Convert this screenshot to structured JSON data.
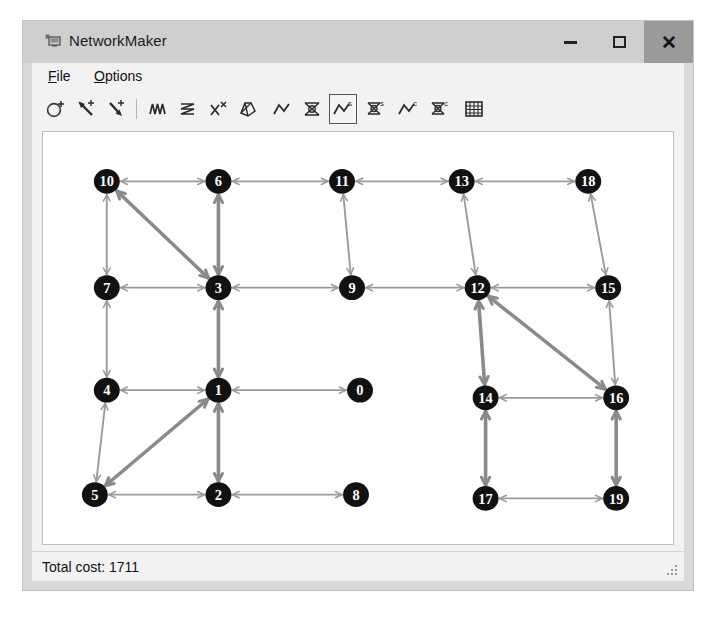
{
  "window": {
    "title": "NetworkMaker",
    "app_icon": "app-window-icon",
    "controls": {
      "minimize": "minimize-icon",
      "maximize": "maximize-icon",
      "close": "close-icon"
    }
  },
  "menu": {
    "items": [
      {
        "label": "File",
        "accel": "F"
      },
      {
        "label": "Options",
        "accel": "O"
      }
    ]
  },
  "toolbar": {
    "tools": [
      {
        "name": "add-node-icon",
        "title": "Add node",
        "selected": false
      },
      {
        "name": "add-edge-icon",
        "title": "Add edge",
        "selected": false
      },
      {
        "name": "add-directed-edge-icon",
        "title": "Add directed edge",
        "selected": false
      },
      {
        "name": "random-walk-icon",
        "title": "Random walk",
        "selected": false
      },
      {
        "name": "zigzag-path-icon",
        "title": "Zigzag path",
        "selected": false
      },
      {
        "name": "cross-edges-icon",
        "title": "Cross edges",
        "selected": false
      },
      {
        "name": "minimum-spanning-tree-icon",
        "title": "Minimum spanning tree",
        "selected": false
      },
      {
        "name": "shortest-path-icon",
        "title": "Shortest path",
        "selected": false
      },
      {
        "name": "network-flow-icon",
        "title": "Network flow",
        "selected": false
      },
      {
        "name": "network-flow-source-icon",
        "title": "Network flow (source)",
        "selected": true
      },
      {
        "name": "spanning-tree-source-icon",
        "title": "Spanning tree (source)",
        "selected": false
      },
      {
        "name": "shortest-path-cost-icon",
        "title": "Shortest path (cost)",
        "selected": false
      },
      {
        "name": "spanning-tree-cost-icon",
        "title": "Spanning tree (cost)",
        "selected": false
      },
      {
        "name": "grid-icon",
        "title": "Grid",
        "selected": false
      }
    ]
  },
  "status": {
    "total_cost_label": "Total cost: 1711"
  },
  "colors": {
    "node_fill": "#111111",
    "node_label": "#ffffff",
    "edge_normal": "#9b9b9b",
    "edge_highlight": "#8a8a8a",
    "canvas": "#fefefe",
    "window_chrome": "#cfcfcf",
    "client": "#f2f2f2",
    "close_button": "#9a9a9a"
  },
  "graph": {
    "node_radius": 13,
    "nodes": [
      {
        "id": "10",
        "x": 64,
        "y": 52
      },
      {
        "id": "6",
        "x": 176,
        "y": 52
      },
      {
        "id": "11",
        "x": 300,
        "y": 52
      },
      {
        "id": "13",
        "x": 420,
        "y": 52
      },
      {
        "id": "18",
        "x": 547,
        "y": 52
      },
      {
        "id": "7",
        "x": 64,
        "y": 164
      },
      {
        "id": "3",
        "x": 176,
        "y": 164
      },
      {
        "id": "9",
        "x": 310,
        "y": 164
      },
      {
        "id": "12",
        "x": 436,
        "y": 164
      },
      {
        "id": "15",
        "x": 567,
        "y": 164
      },
      {
        "id": "4",
        "x": 64,
        "y": 272
      },
      {
        "id": "1",
        "x": 176,
        "y": 272
      },
      {
        "id": "0",
        "x": 318,
        "y": 272
      },
      {
        "id": "14",
        "x": 444,
        "y": 280
      },
      {
        "id": "16",
        "x": 575,
        "y": 280
      },
      {
        "id": "5",
        "x": 52,
        "y": 382
      },
      {
        "id": "2",
        "x": 176,
        "y": 382
      },
      {
        "id": "8",
        "x": 314,
        "y": 382
      },
      {
        "id": "17",
        "x": 444,
        "y": 386
      },
      {
        "id": "19",
        "x": 575,
        "y": 386
      }
    ],
    "edges": [
      {
        "from": "10",
        "to": "6",
        "weight": "normal"
      },
      {
        "from": "6",
        "to": "11",
        "weight": "normal"
      },
      {
        "from": "11",
        "to": "13",
        "weight": "normal"
      },
      {
        "from": "13",
        "to": "18",
        "weight": "normal"
      },
      {
        "from": "10",
        "to": "7",
        "weight": "normal"
      },
      {
        "from": "10",
        "to": "3",
        "weight": "thick"
      },
      {
        "from": "6",
        "to": "3",
        "weight": "thick"
      },
      {
        "from": "11",
        "to": "9",
        "weight": "normal"
      },
      {
        "from": "13",
        "to": "12",
        "weight": "normal"
      },
      {
        "from": "18",
        "to": "15",
        "weight": "normal"
      },
      {
        "from": "7",
        "to": "3",
        "weight": "normal"
      },
      {
        "from": "3",
        "to": "9",
        "weight": "normal"
      },
      {
        "from": "9",
        "to": "12",
        "weight": "normal"
      },
      {
        "from": "12",
        "to": "15",
        "weight": "normal"
      },
      {
        "from": "7",
        "to": "4",
        "weight": "normal"
      },
      {
        "from": "3",
        "to": "1",
        "weight": "thick"
      },
      {
        "from": "12",
        "to": "14",
        "weight": "thick"
      },
      {
        "from": "12",
        "to": "16",
        "weight": "thick"
      },
      {
        "from": "15",
        "to": "16",
        "weight": "normal"
      },
      {
        "from": "4",
        "to": "1",
        "weight": "normal"
      },
      {
        "from": "1",
        "to": "0",
        "weight": "normal"
      },
      {
        "from": "14",
        "to": "16",
        "weight": "normal"
      },
      {
        "from": "4",
        "to": "5",
        "weight": "normal"
      },
      {
        "from": "1",
        "to": "2",
        "weight": "thick"
      },
      {
        "from": "1",
        "to": "5",
        "weight": "thick"
      },
      {
        "from": "14",
        "to": "17",
        "weight": "thick"
      },
      {
        "from": "16",
        "to": "19",
        "weight": "thick"
      },
      {
        "from": "5",
        "to": "2",
        "weight": "normal"
      },
      {
        "from": "2",
        "to": "8",
        "weight": "normal"
      },
      {
        "from": "17",
        "to": "19",
        "weight": "normal"
      }
    ]
  }
}
